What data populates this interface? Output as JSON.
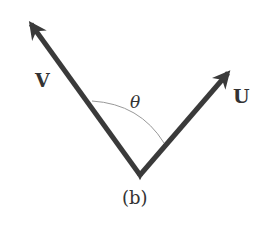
{
  "figure": {
    "caption": "(b)",
    "vectors": [
      {
        "name": "V",
        "label": "V",
        "tail": [
          140,
          175
        ],
        "head": [
          28,
          20
        ]
      },
      {
        "name": "U",
        "label": "U",
        "tail": [
          140,
          175
        ],
        "head": [
          232,
          69
        ]
      }
    ],
    "angle": {
      "label": "θ",
      "between": [
        "V",
        "U"
      ]
    },
    "colors": {
      "stroke": "#3a3a3a",
      "arc": "#999999",
      "text": "#333333",
      "background": "#ffffff"
    }
  }
}
